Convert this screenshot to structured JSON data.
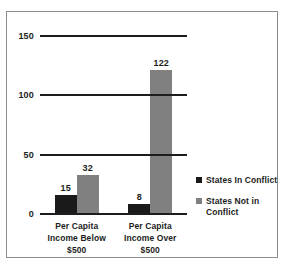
{
  "chart_data": {
    "type": "bar",
    "title": "",
    "xlabel": "",
    "ylabel": "",
    "ylim": [
      0,
      150
    ],
    "yticks": [
      0,
      50,
      100,
      150
    ],
    "grid": true,
    "legend_position": "right",
    "categories": [
      "Per Capita Income Below $500",
      "Per Capita Income Over $500"
    ],
    "category_lines": [
      [
        "Per Capita",
        "Income Below",
        "$500"
      ],
      [
        "Per Capita",
        "Income Over",
        "$500"
      ]
    ],
    "series": [
      {
        "name": "States In Conflict",
        "color": "#1a1a1a",
        "values": [
          15,
          8
        ],
        "labels": [
          "15",
          "8"
        ]
      },
      {
        "name": "States Not in Conflict",
        "color": "#808080",
        "values": [
          32,
          122
        ],
        "labels": [
          "32",
          "122"
        ]
      }
    ],
    "legend_lines": [
      [
        "States In Conflict"
      ],
      [
        "States Not in",
        "Conflict"
      ]
    ],
    "ytick_labels": [
      "0",
      "50",
      "100",
      "150"
    ]
  },
  "colors": {
    "series_in_conflict": "#1a1a1a",
    "series_not_in_conflict": "#808080",
    "axis": "#1d1d1d",
    "frame": "#8d8d8d",
    "background": "#ffffff"
  }
}
